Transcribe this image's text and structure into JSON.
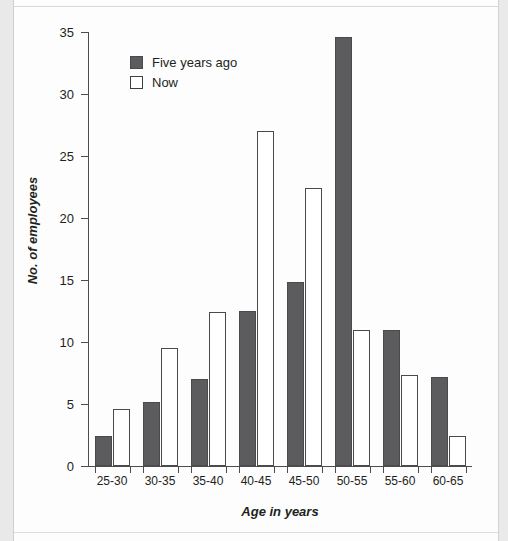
{
  "chart_data": {
    "type": "bar",
    "title": "",
    "xlabel": "Age in years",
    "ylabel": "No. of employees",
    "categories": [
      "25-30",
      "30-35",
      "35-40",
      "40-45",
      "45-50",
      "50-55",
      "55-60",
      "60-65"
    ],
    "series": [
      {
        "name": "Five years ago",
        "color": "#5c5c5e",
        "style": "filled",
        "values": [
          2.4,
          5.2,
          7.0,
          12.5,
          14.8,
          34.6,
          11.0,
          7.2
        ]
      },
      {
        "name": "Now",
        "color": "#ffffff",
        "style": "outlined",
        "values": [
          4.6,
          9.5,
          12.4,
          27.0,
          22.4,
          11.0,
          7.3,
          2.4
        ]
      }
    ],
    "ylim": [
      0,
      35
    ],
    "yticks": [
      0,
      5,
      10,
      15,
      20,
      25,
      30,
      35
    ],
    "ytick_labels": [
      "0",
      "5",
      "10",
      "15",
      "20",
      "25",
      "30",
      "35"
    ],
    "grid": false,
    "legend_position": "upper left inside plot",
    "axis_color": "#4d4d4d",
    "text_color": "#231f20"
  },
  "legend": {
    "entries": [
      {
        "label": "Five years ago",
        "swatch": "filled-dark-square"
      },
      {
        "label": "Now",
        "swatch": "outlined-white-square"
      }
    ]
  },
  "axes": {
    "x_title": "Age in years",
    "y_title": "No. of employees"
  }
}
